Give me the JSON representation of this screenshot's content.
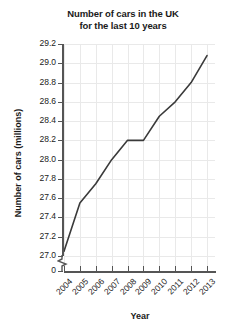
{
  "chart_data": {
    "type": "line",
    "title": "Number of cars in the UK for the last 10 years",
    "title_line1": "Number of cars in the UK",
    "title_line2": "for the last 10 years",
    "xlabel": "Year",
    "ylabel": "Number of cars (millions)",
    "categories": [
      "2004",
      "2005",
      "2006",
      "2007",
      "2008",
      "2009",
      "2010",
      "2011",
      "2012",
      "2013"
    ],
    "values": [
      27.05,
      27.55,
      27.75,
      28.0,
      28.2,
      28.2,
      28.45,
      28.6,
      28.8,
      29.08
    ],
    "ylim": [
      27.0,
      29.2
    ],
    "ytick_labels": [
      "29.2",
      "29.0",
      "28.8",
      "28.6",
      "28.4",
      "28.2",
      "28.0",
      "27.8",
      "27.6",
      "27.4",
      "27.2",
      "27.0",
      "0"
    ],
    "ytick_values": [
      29.2,
      29.0,
      28.8,
      28.6,
      28.4,
      28.2,
      28.0,
      27.8,
      27.6,
      27.4,
      27.2,
      27.0
    ],
    "axis_break": true,
    "axis_break_label": "0",
    "grid": true,
    "legend": null,
    "line_color": "#3a3a3a",
    "grid_color": "#e9e9e9",
    "axis_color": "#555555",
    "background_color": "#ffffff"
  }
}
